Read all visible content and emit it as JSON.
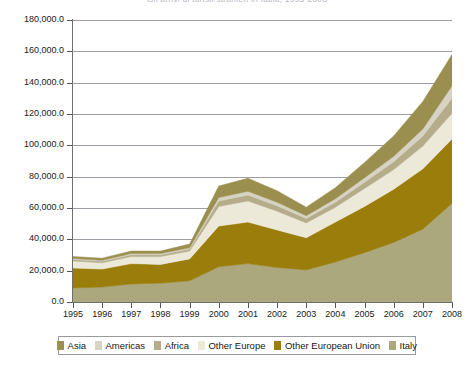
{
  "title": "Gli arrivi di turisti stranieri in Italia, 1995-2008",
  "chart_data": {
    "type": "area",
    "stacked": true,
    "title": "Gli arrivi di turisti stranieri in Italia, 1995-2008",
    "xlabel": "",
    "ylabel": "",
    "ylim": [
      0,
      180000
    ],
    "grid": true,
    "legend_position": "bottom",
    "categories": [
      "1995",
      "1996",
      "1997",
      "1998",
      "1999",
      "2000",
      "2001",
      "2002",
      "2003",
      "2004",
      "2005",
      "2006",
      "2007",
      "2008"
    ],
    "y_ticks": [
      "0.0",
      "20,000.0",
      "40,000.0",
      "60,000.0",
      "80,000.0",
      "100,000.0",
      "120,000.0",
      "140,000.0",
      "160,000.0",
      "180,000.0"
    ],
    "y_tick_values": [
      0,
      20000,
      40000,
      60000,
      80000,
      100000,
      120000,
      140000,
      160000,
      180000
    ],
    "stack_order_bottom_to_top": [
      "Italy",
      "Other European Union",
      "Other Europe",
      "Africa",
      "Americas",
      "Asia"
    ],
    "series": [
      {
        "name": "Italy",
        "color": "#aca87e",
        "values": [
          9000,
          9500,
          11500,
          12000,
          13500,
          22500,
          24500,
          22000,
          20500,
          25500,
          31500,
          38000,
          46500,
          63000
        ]
      },
      {
        "name": "Other European Union",
        "color": "#9a7d0a",
        "values": [
          12700,
          11500,
          13000,
          12000,
          14000,
          26000,
          26500,
          24000,
          20500,
          25500,
          29500,
          34000,
          38500,
          41000
        ]
      },
      {
        "name": "Other Europe",
        "color": "#ede9d8",
        "values": [
          4500,
          4000,
          4500,
          5000,
          5000,
          12500,
          13500,
          12000,
          9500,
          9500,
          11500,
          12500,
          14500,
          16500
        ]
      },
      {
        "name": "Africa",
        "color": "#b5ad89",
        "values": [
          1000,
          1000,
          1200,
          1200,
          1300,
          3500,
          3800,
          3500,
          2800,
          3200,
          4000,
          5000,
          6500,
          9500
        ]
      },
      {
        "name": "Americas",
        "color": "#d6d2c4",
        "values": [
          600,
          600,
          700,
          700,
          800,
          2200,
          2400,
          2200,
          1800,
          2200,
          2800,
          3500,
          4500,
          8000
        ]
      },
      {
        "name": "Asia",
        "color": "#9b8f4f",
        "values": [
          1200,
          1400,
          1600,
          1600,
          2400,
          7300,
          8300,
          7300,
          5400,
          7100,
          9700,
          13000,
          17500,
          20000
        ]
      }
    ],
    "stacked_totals": [
      29000,
      28000,
      32500,
      32500,
      37000,
      74000,
      79000,
      71000,
      60500,
      73000,
      89000,
      106000,
      128000,
      158000
    ]
  },
  "legend": {
    "items": [
      {
        "label": "Asia",
        "color": "#9b8f4f"
      },
      {
        "label": "Americas",
        "color": "#d6d2c4"
      },
      {
        "label": "Africa",
        "color": "#b5ad89"
      },
      {
        "label": "Other Europe",
        "color": "#ede9d8"
      },
      {
        "label": "Other European Union",
        "color": "#9a7d0a"
      },
      {
        "label": "Italy",
        "color": "#aca87e"
      }
    ]
  }
}
